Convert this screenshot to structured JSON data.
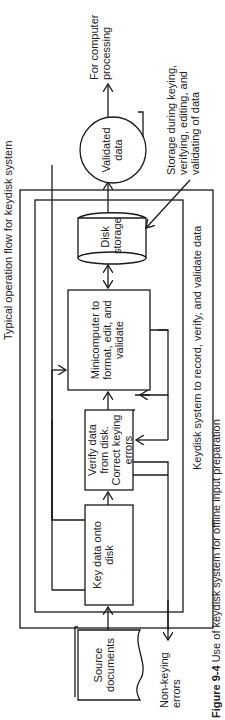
{
  "figure": {
    "caption_label": "Figure 9-4",
    "caption_text": "Use of keydisk system for offline input preparation",
    "outer_box_label": "Typical operation flow for keydisk system",
    "inner_box_label": "Keydisk system to record, verify, and validate data"
  },
  "nodes": {
    "source_documents": "Source documents",
    "key_data": "Key data onto disk",
    "verify_data": "Verify data from disk. Correct keying errors",
    "minicomputer": "Minicomputer to format, edit, and validate",
    "disk_storage": "Disk storage",
    "validated_data": "Validated data",
    "output": "For computer processing",
    "non_keying_errors": "Non-keying errors",
    "storage_note": "Storage during keying, verifying, editing, and validating of data"
  },
  "colors": {
    "line": "#1a1a1a",
    "background": "#ffffff"
  }
}
